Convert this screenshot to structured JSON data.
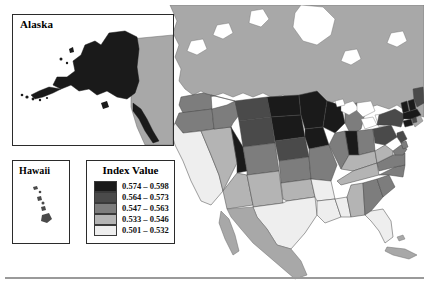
{
  "figure": {
    "type": "choropleth-map",
    "region": "United States",
    "background_color": "#ffffff",
    "frame_color": "#2b2b2b"
  },
  "insets": {
    "alaska": {
      "title": "Alaska",
      "fill_class_index": 0,
      "fill_color": "#1a1a1a"
    },
    "hawaii": {
      "title": "Hawaii",
      "fill_class_index": 1,
      "fill_color": "#4a4a4a"
    }
  },
  "legend": {
    "title": "Index Value",
    "position": "lower-left",
    "items": [
      {
        "label": "0.574 – 0.598",
        "color": "#1a1a1a",
        "min": 0.574,
        "max": 0.598
      },
      {
        "label": "0.564 – 0.573",
        "color": "#4a4a4a",
        "min": 0.564,
        "max": 0.573
      },
      {
        "label": "0.547 – 0.563",
        "color": "#7d7d7d",
        "min": 0.547,
        "max": 0.563
      },
      {
        "label": "0.533 – 0.546",
        "color": "#b4b4b4",
        "min": 0.533,
        "max": 0.546
      },
      {
        "label": "0.501 – 0.532",
        "color": "#eeeeee",
        "min": 0.501,
        "max": 0.532
      }
    ]
  },
  "map": {
    "neighbor_fill": "#a8a8a8",
    "ocean_fill": "#ffffff",
    "border_stroke": "#444444",
    "lake_fill": "#ffffff",
    "neighbors": [
      {
        "name": "Canada",
        "fill": "#a8a8a8"
      },
      {
        "name": "Mexico",
        "fill": "#a8a8a8"
      },
      {
        "name": "Cuba",
        "fill": "#a8a8a8"
      }
    ]
  },
  "chart_data": {
    "type": "choropleth",
    "title": "Index Value",
    "value_field": "Index Value",
    "classes": 5,
    "class_breaks": [
      0.501,
      0.533,
      0.547,
      0.564,
      0.574,
      0.598
    ],
    "colors": [
      "#1a1a1a",
      "#4a4a4a",
      "#7d7d7d",
      "#b4b4b4",
      "#eeeeee"
    ],
    "legend_labels": [
      "0.574 – 0.598",
      "0.564 – 0.573",
      "0.547 – 0.563",
      "0.533 – 0.546",
      "0.501 – 0.532"
    ],
    "value_range": [
      0.501,
      0.598
    ],
    "regions": [
      {
        "code": "AK",
        "name": "Alaska",
        "class": 0
      },
      {
        "code": "HI",
        "name": "Hawaii",
        "class": 1
      },
      {
        "code": "WA",
        "name": "Washington",
        "class": 2
      },
      {
        "code": "OR",
        "name": "Oregon",
        "class": 2
      },
      {
        "code": "CA",
        "name": "California",
        "class": 4
      },
      {
        "code": "NV",
        "name": "Nevada",
        "class": 3
      },
      {
        "code": "ID",
        "name": "Idaho",
        "class": 2
      },
      {
        "code": "MT",
        "name": "Montana",
        "class": 1
      },
      {
        "code": "WY",
        "name": "Wyoming",
        "class": 1
      },
      {
        "code": "UT",
        "name": "Utah",
        "class": 0
      },
      {
        "code": "AZ",
        "name": "Arizona",
        "class": 3
      },
      {
        "code": "CO",
        "name": "Colorado",
        "class": 2
      },
      {
        "code": "NM",
        "name": "New Mexico",
        "class": 3
      },
      {
        "code": "ND",
        "name": "North Dakota",
        "class": 0
      },
      {
        "code": "SD",
        "name": "South Dakota",
        "class": 0
      },
      {
        "code": "NE",
        "name": "Nebraska",
        "class": 1
      },
      {
        "code": "KS",
        "name": "Kansas",
        "class": 2
      },
      {
        "code": "OK",
        "name": "Oklahoma",
        "class": 3
      },
      {
        "code": "TX",
        "name": "Texas",
        "class": 4
      },
      {
        "code": "MN",
        "name": "Minnesota",
        "class": 0
      },
      {
        "code": "IA",
        "name": "Iowa",
        "class": 0
      },
      {
        "code": "MO",
        "name": "Missouri",
        "class": 2
      },
      {
        "code": "AR",
        "name": "Arkansas",
        "class": 4
      },
      {
        "code": "LA",
        "name": "Louisiana",
        "class": 4
      },
      {
        "code": "WI",
        "name": "Wisconsin",
        "class": 0
      },
      {
        "code": "IL",
        "name": "Illinois",
        "class": 2
      },
      {
        "code": "MS",
        "name": "Mississippi",
        "class": 4
      },
      {
        "code": "MI",
        "name": "Michigan",
        "class": 2
      },
      {
        "code": "IN",
        "name": "Indiana",
        "class": 0
      },
      {
        "code": "KY",
        "name": "Kentucky",
        "class": 3
      },
      {
        "code": "TN",
        "name": "Tennessee",
        "class": 3
      },
      {
        "code": "AL",
        "name": "Alabama",
        "class": 3
      },
      {
        "code": "OH",
        "name": "Ohio",
        "class": 2
      },
      {
        "code": "GA",
        "name": "Georgia",
        "class": 2
      },
      {
        "code": "FL",
        "name": "Florida",
        "class": 4
      },
      {
        "code": "SC",
        "name": "South Carolina",
        "class": 2
      },
      {
        "code": "NC",
        "name": "North Carolina",
        "class": 2
      },
      {
        "code": "VA",
        "name": "Virginia",
        "class": 2
      },
      {
        "code": "WV",
        "name": "West Virginia",
        "class": 3
      },
      {
        "code": "PA",
        "name": "Pennsylvania",
        "class": 1
      },
      {
        "code": "NY",
        "name": "New York",
        "class": 1
      },
      {
        "code": "MD",
        "name": "Maryland",
        "class": 2
      },
      {
        "code": "DE",
        "name": "Delaware",
        "class": 2
      },
      {
        "code": "NJ",
        "name": "New Jersey",
        "class": 1
      },
      {
        "code": "CT",
        "name": "Connecticut",
        "class": 0
      },
      {
        "code": "RI",
        "name": "Rhode Island",
        "class": 1
      },
      {
        "code": "MA",
        "name": "Massachusetts",
        "class": 0
      },
      {
        "code": "VT",
        "name": "Vermont",
        "class": 0
      },
      {
        "code": "NH",
        "name": "New Hampshire",
        "class": 0
      },
      {
        "code": "ME",
        "name": "Maine",
        "class": 1
      }
    ]
  }
}
